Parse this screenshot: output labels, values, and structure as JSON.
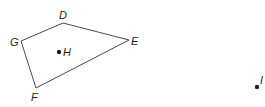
{
  "figure": {
    "type": "geometry-diagram",
    "stroke_color": "#4a4a4a",
    "text_color": "#231f20",
    "polygon": {
      "name": "quadrilateral DEFG",
      "vertices": [
        {
          "label": "D",
          "x": 63,
          "y": 23
        },
        {
          "label": "E",
          "x": 129,
          "y": 40
        },
        {
          "label": "F",
          "x": 36,
          "y": 88
        },
        {
          "label": "G",
          "x": 21,
          "y": 41
        }
      ]
    },
    "points": [
      {
        "label": "H",
        "x": 59,
        "y": 52,
        "position": "inside polygon"
      },
      {
        "label": "I",
        "x": 257,
        "y": 87,
        "position": "outside polygon"
      }
    ]
  }
}
